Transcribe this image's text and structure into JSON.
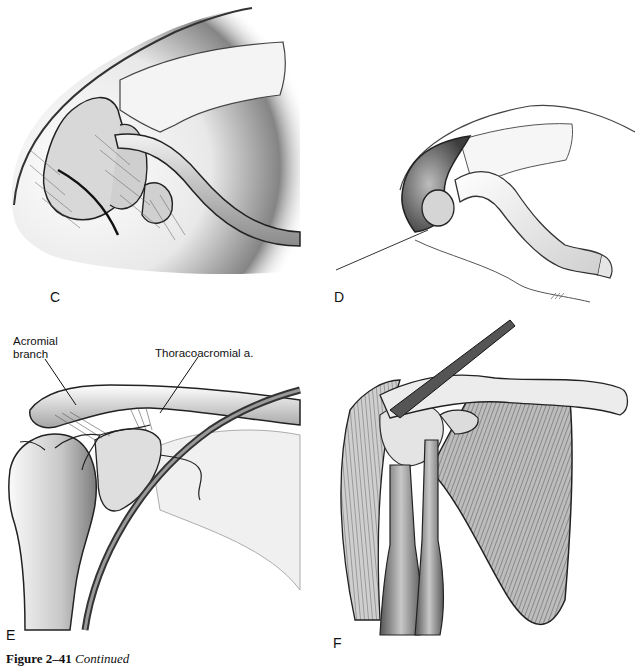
{
  "figure": {
    "number_label": "Figure 2–41",
    "continuation_label": "Continued"
  },
  "panels": [
    {
      "id": "C",
      "letter": "C",
      "subject": "shoulder joint with capsule and coracoid process, superior-lateral view"
    },
    {
      "id": "D",
      "letter": "D",
      "subject": "shoulder joint with deltoid reflected, exposure of humeral head"
    },
    {
      "id": "E",
      "letter": "E",
      "subject": "shoulder joint with thoracoacromial artery branches",
      "callouts": [
        {
          "text": "Acromial\nbranch"
        },
        {
          "text": "Thoracoacromial a."
        }
      ]
    },
    {
      "id": "F",
      "letter": "F",
      "subject": "anterior shoulder musculature with subscapularis and biceps"
    }
  ],
  "colors": {
    "ink": "#111111",
    "shade_dark": "#4a4a4a",
    "shade_mid": "#8c8c8c",
    "shade_light": "#d6d6d6",
    "paper": "#ffffff"
  }
}
